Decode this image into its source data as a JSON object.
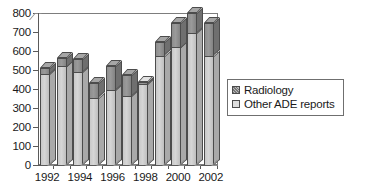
{
  "chart_data": {
    "type": "bar",
    "title": "",
    "subtitle": "",
    "xlabel": "",
    "ylabel": "",
    "ylim": [
      0,
      800
    ],
    "ytick_step": 100,
    "yticks": [
      "800",
      "700",
      "600",
      "500",
      "400",
      "300",
      "200",
      "100",
      "0"
    ],
    "grid": false,
    "stacked": true,
    "three_d": true,
    "legend_position": "right",
    "categories": [
      "1992",
      "1993",
      "1994",
      "1995",
      "1996",
      "1997",
      "1998",
      "1999",
      "2000",
      "2001",
      "2002"
    ],
    "visible_tick_labels": [
      "1992",
      "1994",
      "1996",
      "1998",
      "2000",
      "2002"
    ],
    "series": [
      {
        "name": "Other ADE reports",
        "color": "#d0d0d0",
        "values": [
          480,
          520,
          490,
          355,
          395,
          365,
          425,
          575,
          620,
          695,
          575
        ]
      },
      {
        "name": "Radiology",
        "color": "#8e8e8e",
        "values": [
          30,
          45,
          70,
          75,
          125,
          110,
          10,
          70,
          130,
          105,
          170
        ]
      }
    ],
    "totals": [
      510,
      565,
      560,
      430,
      520,
      475,
      435,
      645,
      750,
      800,
      745
    ]
  },
  "legend": {
    "entries": [
      {
        "label": "Radiology",
        "swatch": "dark-hatch-swatch"
      },
      {
        "label": "Other ADE reports",
        "swatch": "light-swatch"
      }
    ]
  },
  "colors": {
    "radiology": "#8e8e8e",
    "other_ade_reports": "#d0d0d0",
    "axis": "#5a5a5a",
    "frame": "#7d7d7d",
    "text": "#1a1a1a",
    "background": "#ffffff"
  }
}
